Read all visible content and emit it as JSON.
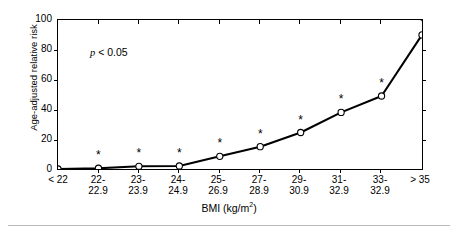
{
  "chart_data": {
    "type": "line",
    "title": "",
    "subtitle": "",
    "xlabel": "BMI (kg/m2)",
    "ylabel": "Age-adjusted relative risk",
    "ylim": [
      0,
      100
    ],
    "yticks": [
      0,
      20,
      40,
      60,
      80,
      100
    ],
    "grid": false,
    "legend": null,
    "annotations": [
      {
        "text": "p < 0.05",
        "x_rel": 0.09,
        "y_value": 80
      }
    ],
    "marker": "open-circle",
    "significance_marker": "*",
    "categories": [
      "< 22",
      "22-22.9",
      "23-23.9",
      "24-24.9",
      "25-26.9",
      "27-28.9",
      "29-30.9",
      "31-32.9",
      "33-32.9",
      "> 35"
    ],
    "category_lines": [
      [
        "< 22",
        ""
      ],
      [
        "22-",
        "22.9"
      ],
      [
        "23-",
        "23.9"
      ],
      [
        "24-",
        "24.9"
      ],
      [
        "25-",
        "26.9"
      ],
      [
        "27-",
        "28.9"
      ],
      [
        "29-",
        "30.9"
      ],
      [
        "31-",
        "32.9"
      ],
      [
        "33-",
        "32.9"
      ],
      [
        "> 35",
        ""
      ]
    ],
    "values": [
      0,
      0.5,
      1.8,
      2,
      8.5,
      15,
      24.5,
      38,
      49,
      90
    ],
    "significant": [
      false,
      true,
      true,
      true,
      true,
      true,
      true,
      true,
      true,
      true
    ],
    "series": [
      {
        "name": "Age-adjusted relative risk",
        "values": [
          0,
          0.5,
          1.8,
          2,
          8.5,
          15,
          24.5,
          38,
          49,
          90
        ]
      }
    ]
  },
  "axis": {
    "y_title": "Age-adjusted relative risk",
    "x_title_main": "BMI (kg/m",
    "x_title_sup": "2",
    "x_title_close": ")",
    "y_tick_labels": [
      "100",
      "80",
      "60",
      "40",
      "20",
      "0"
    ]
  },
  "annotation": {
    "p_value_italic": "p",
    "p_value_rest": " < 0.05"
  },
  "colors": {
    "line": "#000000",
    "marker_fill": "#ffffff",
    "marker_stroke": "#000000",
    "axis": "#000000",
    "footer_rule": "#b9b9b9"
  }
}
